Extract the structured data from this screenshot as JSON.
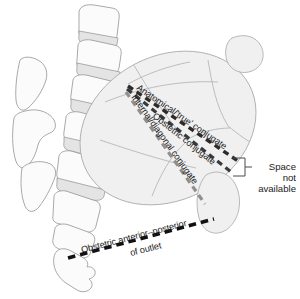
{
  "figure": {
    "background_color": "#ffffff"
  },
  "measurement_lines": [
    {
      "id": "anatomical-true-conjugate",
      "label": "Anatomical/'true' conjugate",
      "color": "#2b2b2b",
      "style": "dashed"
    },
    {
      "id": "obstetric-conjugate",
      "label": "Obstetric conjugate",
      "color": "#3a3a3a",
      "style": "dashed"
    },
    {
      "id": "internal-diagonal-conjugate",
      "label": "Internal/diagonal conjugate",
      "color": "#8f8f8f",
      "style": "dashed"
    },
    {
      "id": "obstetric-anterior-posterior-of-outlet",
      "label_line1": "Obstetric anterior–posterior",
      "label_line2": "of outlet",
      "color": "#111111",
      "style": "dashed"
    }
  ],
  "callout": {
    "id": "space-not-available",
    "line1": "Space",
    "line2": "not",
    "line3": "available",
    "bracket_color": "#4a4a4a"
  },
  "anatomy": {
    "pelvis_label": "pelvis-outline",
    "sacrum_label": "sacrum",
    "coccyx_label": "coccyx",
    "vertebrae_label": "lumbar-vertebrae",
    "spinous_label": "spinous-processes",
    "pubis_label": "pubic-bone",
    "outline_color": "#9a9a9a",
    "fill_color": "#f2f2f2"
  }
}
